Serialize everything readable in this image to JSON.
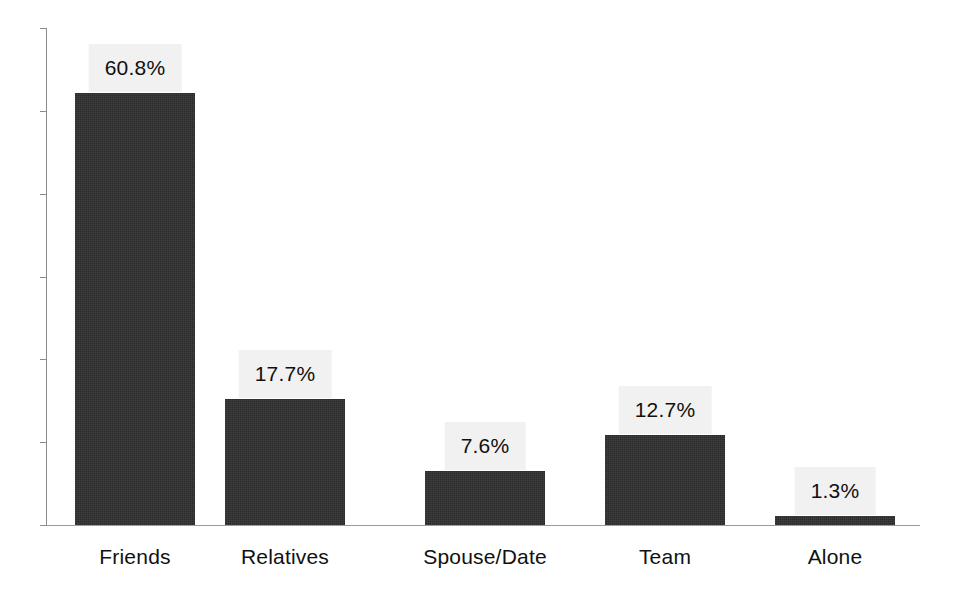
{
  "chart_data": {
    "type": "bar",
    "title": "",
    "subtitle": "",
    "xlabel": "",
    "ylabel": "",
    "categories": [
      "Friends",
      "Relatives",
      "Spouse/Date",
      "Team",
      "Alone"
    ],
    "values": [
      60.8,
      17.7,
      7.6,
      12.7,
      1.3
    ],
    "value_labels": [
      "60.8%",
      "17.7%",
      "7.6%",
      "12.7%",
      "1.3%"
    ],
    "ylim": [
      0,
      70
    ],
    "y_tick_count": 7,
    "y_tick_labels": [],
    "grid": false,
    "legend": false,
    "legend_position": "none",
    "series": [
      {
        "name": "",
        "values": [
          60.8,
          17.7,
          7.6,
          12.7,
          1.3
        ]
      }
    ],
    "colors": {
      "bar_fill": "#2b2b2b",
      "label_box": "#f1f1f1",
      "label_text": "#101010",
      "axis": "#8c8c8c",
      "background": "#ffffff"
    }
  },
  "axes": {
    "y_axis_name": "y-axis",
    "x_axis_name": "x-axis"
  }
}
